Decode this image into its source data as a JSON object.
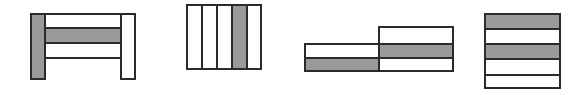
{
  "colors": {
    "stroke": "#2b2b2b",
    "shaded": "#9a9a9a",
    "blank": "#ffffff"
  },
  "figures": [
    {
      "name": "figure-1-frame",
      "cells": [
        {
          "x": 30,
          "y": 13,
          "w": 16,
          "h": 67,
          "fill": "shaded"
        },
        {
          "x": 120,
          "y": 13,
          "w": 16,
          "h": 67,
          "fill": "blank"
        },
        {
          "x": 44,
          "y": 13,
          "w": 78,
          "h": 16,
          "fill": "blank"
        },
        {
          "x": 44,
          "y": 27,
          "w": 78,
          "h": 17,
          "fill": "shaded"
        },
        {
          "x": 44,
          "y": 42,
          "w": 78,
          "h": 17,
          "fill": "blank"
        }
      ]
    },
    {
      "name": "figure-2-vertical-strips",
      "cells": [
        {
          "x": 186,
          "y": 4,
          "w": 17,
          "h": 66,
          "fill": "blank"
        },
        {
          "x": 201,
          "y": 4,
          "w": 17,
          "h": 66,
          "fill": "blank"
        },
        {
          "x": 216,
          "y": 4,
          "w": 17,
          "h": 66,
          "fill": "blank"
        },
        {
          "x": 231,
          "y": 4,
          "w": 17,
          "h": 66,
          "fill": "shaded"
        },
        {
          "x": 246,
          "y": 4,
          "w": 16,
          "h": 66,
          "fill": "blank"
        }
      ]
    },
    {
      "name": "figure-3-stepped-blocks",
      "cells": [
        {
          "x": 378,
          "y": 26,
          "w": 76,
          "h": 19,
          "fill": "blank"
        },
        {
          "x": 378,
          "y": 43,
          "w": 76,
          "h": 16,
          "fill": "shaded"
        },
        {
          "x": 378,
          "y": 57,
          "w": 76,
          "h": 15,
          "fill": "blank"
        },
        {
          "x": 304,
          "y": 43,
          "w": 76,
          "h": 16,
          "fill": "blank"
        },
        {
          "x": 304,
          "y": 57,
          "w": 76,
          "h": 15,
          "fill": "shaded"
        }
      ]
    },
    {
      "name": "figure-4-horizontal-strips",
      "cells": [
        {
          "x": 484,
          "y": 13,
          "w": 77,
          "h": 17,
          "fill": "shaded"
        },
        {
          "x": 484,
          "y": 28,
          "w": 77,
          "h": 17,
          "fill": "blank"
        },
        {
          "x": 484,
          "y": 43,
          "w": 77,
          "h": 17,
          "fill": "shaded"
        },
        {
          "x": 484,
          "y": 58,
          "w": 77,
          "h": 18,
          "fill": "blank"
        },
        {
          "x": 484,
          "y": 74,
          "w": 77,
          "h": 15,
          "fill": "blank"
        }
      ]
    }
  ]
}
